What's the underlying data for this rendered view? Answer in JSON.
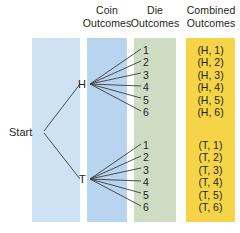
{
  "headers": {
    "coin": {
      "line1": "Coin",
      "line2": "Outcomes"
    },
    "die": {
      "line1": "Die",
      "line2": "Outcomes"
    },
    "combined": {
      "line1": "Combined",
      "line2": "Outcomes"
    }
  },
  "nodes": {
    "start": "Start",
    "heads": "H",
    "tails": "T"
  },
  "die_outcomes": [
    "1",
    "2",
    "3",
    "4",
    "5",
    "6"
  ],
  "combined_outcomes": {
    "heads": [
      "(H, 1)",
      "(H, 2)",
      "(H, 3)",
      "(H, 4)",
      "(H, 5)",
      "(H, 6)"
    ],
    "tails": [
      "(T, 1)",
      "(T, 2)",
      "(T, 3)",
      "(T, 4)",
      "(T, 5)",
      "(T, 6)"
    ]
  },
  "colors": {
    "panel_start": "#cfe2f3",
    "panel_coin": "#b8d4ee",
    "panel_die": "#cfdcc4",
    "panel_combined": "#f5d547",
    "edge": "#3b3b3b",
    "text": "#231f20"
  }
}
